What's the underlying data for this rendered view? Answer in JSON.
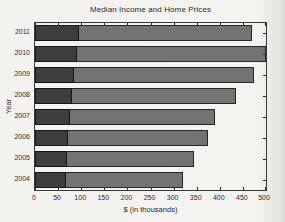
{
  "figure": {
    "paper_color": "#f3f2ef",
    "ink_color": "#2d2d2d"
  },
  "chart_data": {
    "type": "bar",
    "orientation": "horizontal",
    "title": "Median Income and Home Prices",
    "xlabel": "$ (in thousands)",
    "ylabel": "Year",
    "xlim": [
      0,
      500
    ],
    "xticks": [
      0,
      50,
      100,
      150,
      200,
      250,
      300,
      350,
      400,
      450,
      500
    ],
    "categories": [
      "2011",
      "2010",
      "2009",
      "2008",
      "2007",
      "2006",
      "2005",
      "2004"
    ],
    "series": [
      {
        "name": "median-home-price",
        "color": "#737373",
        "border_color": "#262626",
        "values": [
          470,
          500,
          475,
          435,
          390,
          375,
          345,
          320
        ]
      },
      {
        "name": "median-income",
        "color": "#3e3e3e",
        "border_color": "#151515",
        "values": [
          95,
          90,
          85,
          80,
          75,
          72,
          70,
          68
        ]
      }
    ],
    "grid": false,
    "legend_position": "none",
    "axis_style": "boxed-with-inward-ticks"
  }
}
